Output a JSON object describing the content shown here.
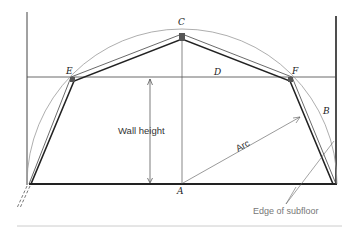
{
  "diagram": {
    "type": "gambrel roof framing layout",
    "points": {
      "A": "A",
      "B": "B",
      "C": "C",
      "D": "D",
      "E": "E",
      "F": "F"
    },
    "labels": {
      "wall_height": "Wall height",
      "arc": "Arc",
      "edge_of_subfloor": "Edge of subfloor"
    },
    "colors": {
      "line": "#222222",
      "arc": "#888888",
      "annotation": "#777777"
    }
  }
}
